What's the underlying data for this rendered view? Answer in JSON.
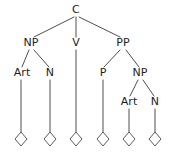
{
  "figure": {
    "name": "constituent-syntax-tree",
    "background_color": "#ffffff",
    "line_color": "#4e4e4e",
    "text_color": "#1d1d1d",
    "leaf_symbol": "diamond"
  },
  "nodes": {
    "root": {
      "label": "C",
      "x": 76,
      "y": 13
    },
    "np1": {
      "label": "NP",
      "x": 31,
      "y": 46
    },
    "v": {
      "label": "V",
      "x": 76,
      "y": 46
    },
    "pp": {
      "label": "PP",
      "x": 123,
      "y": 46
    },
    "art1": {
      "label": "Art",
      "x": 22,
      "y": 76
    },
    "n1": {
      "label": "N",
      "x": 50,
      "y": 76
    },
    "p": {
      "label": "P",
      "x": 103,
      "y": 76
    },
    "np2": {
      "label": "NP",
      "x": 140,
      "y": 76
    },
    "art2": {
      "label": "Art",
      "x": 129,
      "y": 105
    },
    "n2": {
      "label": "N",
      "x": 155,
      "y": 105
    }
  },
  "edges": [
    {
      "name": "edge-c-np",
      "from": "C",
      "to": "NP",
      "x1": 74,
      "y1": 17,
      "x2": 34,
      "y2": 37
    },
    {
      "name": "edge-c-v",
      "from": "C",
      "to": "V",
      "x1": 76,
      "y1": 17,
      "x2": 76,
      "y2": 37
    },
    {
      "name": "edge-c-pp",
      "from": "C",
      "to": "PP",
      "x1": 79,
      "y1": 17,
      "x2": 120,
      "y2": 37
    },
    {
      "name": "edge-np-art",
      "from": "NP",
      "to": "Art",
      "x1": 29,
      "y1": 50,
      "x2": 22,
      "y2": 67
    },
    {
      "name": "edge-np-n",
      "from": "NP",
      "to": "N",
      "x1": 34,
      "y1": 50,
      "x2": 49,
      "y2": 67
    },
    {
      "name": "edge-pp-p",
      "from": "PP",
      "to": "P",
      "x1": 120,
      "y1": 50,
      "x2": 104,
      "y2": 67
    },
    {
      "name": "edge-pp-np2",
      "from": "PP",
      "to": "NP",
      "x1": 126,
      "y1": 50,
      "x2": 139,
      "y2": 67
    },
    {
      "name": "edge-np2-art2",
      "from": "NP",
      "to": "Art",
      "x1": 138,
      "y1": 80,
      "x2": 130,
      "y2": 96
    },
    {
      "name": "edge-np2-n2",
      "from": "NP",
      "to": "N",
      "x1": 143,
      "y1": 80,
      "x2": 154,
      "y2": 96
    },
    {
      "name": "edge-art1-leaf",
      "from": "Art",
      "to": "leaf1",
      "x1": 21,
      "y1": 80,
      "x2": 21,
      "y2": 133
    },
    {
      "name": "edge-n1-leaf",
      "from": "N",
      "to": "leaf2",
      "x1": 50,
      "y1": 80,
      "x2": 50,
      "y2": 133
    },
    {
      "name": "edge-v-leaf",
      "from": "V",
      "to": "leaf3",
      "x1": 76,
      "y1": 50,
      "x2": 76,
      "y2": 133
    },
    {
      "name": "edge-p-leaf",
      "from": "P",
      "to": "leaf4",
      "x1": 103,
      "y1": 80,
      "x2": 103,
      "y2": 133
    },
    {
      "name": "edge-art2-leaf",
      "from": "Art",
      "to": "leaf5",
      "x1": 129,
      "y1": 109,
      "x2": 129,
      "y2": 133
    },
    {
      "name": "edge-n2-leaf",
      "from": "N",
      "to": "leaf6",
      "x1": 155,
      "y1": 109,
      "x2": 155,
      "y2": 133
    }
  ],
  "leaves": [
    {
      "name": "leaf-diamond-1",
      "x": 21,
      "y": 139,
      "rx": 6,
      "ry": 7
    },
    {
      "name": "leaf-diamond-2",
      "x": 50,
      "y": 139,
      "rx": 6,
      "ry": 7
    },
    {
      "name": "leaf-diamond-3",
      "x": 76,
      "y": 139,
      "rx": 6,
      "ry": 7
    },
    {
      "name": "leaf-diamond-4",
      "x": 103,
      "y": 139,
      "rx": 6,
      "ry": 7
    },
    {
      "name": "leaf-diamond-5",
      "x": 129,
      "y": 139,
      "rx": 6,
      "ry": 7
    },
    {
      "name": "leaf-diamond-6",
      "x": 155,
      "y": 139,
      "rx": 6,
      "ry": 7
    }
  ]
}
